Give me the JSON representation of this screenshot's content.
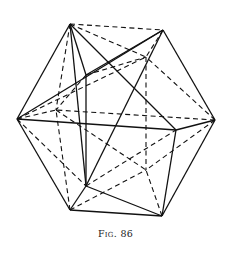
{
  "figure": {
    "caption": "Fig. 86",
    "vertices": {
      "A": [
        70,
        24
      ],
      "B": [
        163,
        30
      ],
      "C": [
        17,
        119
      ],
      "D": [
        215,
        120
      ],
      "E": [
        176,
        130
      ],
      "F": [
        86,
        75
      ],
      "G": [
        70,
        210
      ],
      "H": [
        162,
        216
      ],
      "I": [
        86,
        186
      ],
      "J": [
        146,
        57
      ],
      "K": [
        56,
        110
      ],
      "L": [
        146,
        170
      ]
    },
    "solid_edges": [
      [
        "A",
        "F"
      ],
      [
        "A",
        "E"
      ],
      [
        "A",
        "I"
      ],
      [
        "A",
        "C"
      ],
      [
        "B",
        "C"
      ],
      [
        "B",
        "D"
      ],
      [
        "B",
        "I"
      ],
      [
        "B",
        "F"
      ],
      [
        "C",
        "E"
      ],
      [
        "C",
        "G"
      ],
      [
        "D",
        "E"
      ],
      [
        "D",
        "H"
      ],
      [
        "E",
        "H"
      ],
      [
        "F",
        "I"
      ],
      [
        "G",
        "I"
      ],
      [
        "G",
        "H"
      ],
      [
        "I",
        "H"
      ]
    ],
    "dashed_edges": [
      [
        "A",
        "B"
      ],
      [
        "A",
        "K"
      ],
      [
        "A",
        "J"
      ],
      [
        "B",
        "J"
      ],
      [
        "C",
        "K"
      ],
      [
        "C",
        "J"
      ],
      [
        "C",
        "I"
      ],
      [
        "D",
        "J"
      ],
      [
        "D",
        "L"
      ],
      [
        "D",
        "K"
      ],
      [
        "F",
        "J"
      ],
      [
        "F",
        "K"
      ],
      [
        "G",
        "K"
      ],
      [
        "G",
        "L"
      ],
      [
        "H",
        "L"
      ],
      [
        "J",
        "L"
      ],
      [
        "K",
        "L"
      ],
      [
        "I",
        "E"
      ]
    ]
  }
}
